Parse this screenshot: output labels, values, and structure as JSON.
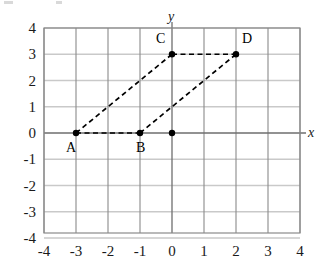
{
  "figure": {
    "title": "",
    "axis_labels": {
      "x": "x",
      "y": "y"
    }
  },
  "chart_data": {
    "type": "scatter",
    "title": "",
    "xlabel": "x",
    "ylabel": "y",
    "xlim": [
      -4,
      4
    ],
    "ylim": [
      -4,
      4
    ],
    "grid": true,
    "legend": "none",
    "x_ticks": [
      "-4",
      "-3",
      "-2",
      "-1",
      "0",
      "1",
      "2",
      "3",
      "4"
    ],
    "y_ticks": [
      "4",
      "3",
      "2",
      "1",
      "0",
      "-1",
      "-2",
      "-3",
      "-4"
    ],
    "x_tick_values": [
      -4,
      -3,
      -2,
      -1,
      0,
      1,
      2,
      3,
      4
    ],
    "y_tick_values": [
      4,
      3,
      2,
      1,
      0,
      -1,
      -2,
      -3,
      -4
    ],
    "points": [
      {
        "label": "A",
        "x": -3,
        "y": 0,
        "label_dx": -10,
        "label_dy": 8
      },
      {
        "label": "B",
        "x": -1,
        "y": 0,
        "label_dx": -4,
        "label_dy": 8
      },
      {
        "label": "C",
        "x": 0,
        "y": 3,
        "label_dx": -16,
        "label_dy": -22
      },
      {
        "label": "D",
        "x": 2,
        "y": 3,
        "label_dx": 6,
        "label_dy": -22
      },
      {
        "label": "",
        "x": 0,
        "y": 0,
        "label_dx": 0,
        "label_dy": 0
      }
    ],
    "segments": [
      {
        "name": "AB",
        "from": [
          -3,
          0
        ],
        "to": [
          -1,
          0
        ],
        "style": "dashed"
      },
      {
        "name": "AC",
        "from": [
          -3,
          0
        ],
        "to": [
          0,
          3
        ],
        "style": "dashed"
      },
      {
        "name": "CD",
        "from": [
          0,
          3
        ],
        "to": [
          2,
          3
        ],
        "style": "dashed"
      },
      {
        "name": "BD",
        "from": [
          -1,
          0
        ],
        "to": [
          2,
          3
        ],
        "style": "dashed"
      }
    ],
    "shape": "parallelogram ABDC",
    "colors": {
      "grid_vertical": "#8a8a8a",
      "grid_horizontal": "#c9c9c9",
      "axis": "#6e6e6e",
      "segment": "#000000",
      "point": "#000000",
      "background": "#ffffff",
      "text": "#1a1a1a"
    }
  },
  "geometry": {
    "plot_left": 44,
    "plot_right": 300,
    "plot_top": 28,
    "plot_bottom": 233,
    "origin_x": 172,
    "origin_y": 133,
    "unit_x": 32,
    "unit_y": 26.25
  }
}
